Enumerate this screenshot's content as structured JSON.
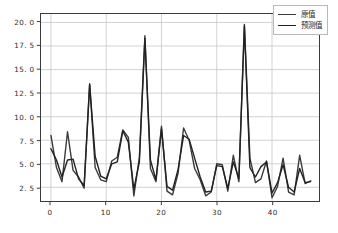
{
  "chart_data": {
    "type": "line",
    "title": "",
    "xlabel": "",
    "ylabel": "",
    "xlim": [
      -1.8,
      48.5
    ],
    "ylim": [
      1.05,
      20.9
    ],
    "grid": true,
    "legend_position": "upper right",
    "xticks": [
      0,
      10,
      20,
      30,
      40
    ],
    "xticklabels": [
      "0",
      "10",
      "20",
      "30",
      "40"
    ],
    "yticks": [
      2.5,
      5.0,
      7.5,
      10.0,
      12.5,
      15.0,
      17.5,
      20.0
    ],
    "yticklabels": [
      "2. 5",
      "5. 0",
      "7. 5",
      "10. 0",
      "12. 5",
      "15. 0",
      "17. 5",
      "20. 0"
    ],
    "x": [
      0,
      1,
      2,
      3,
      4,
      5,
      6,
      7,
      8,
      9,
      10,
      11,
      12,
      13,
      14,
      15,
      16,
      17,
      18,
      19,
      20,
      21,
      22,
      23,
      24,
      25,
      26,
      27,
      28,
      29,
      30,
      31,
      32,
      33,
      34,
      35,
      36,
      37,
      38,
      39,
      40,
      41,
      42,
      43,
      44,
      45,
      46,
      47
    ],
    "series": [
      {
        "name": "原值",
        "color": "#3a3a3a",
        "linewidth": 1.4,
        "values": [
          8.0,
          4.6,
          3.1,
          8.4,
          4.3,
          3.6,
          2.4,
          13.5,
          4.6,
          3.3,
          3.1,
          5.3,
          5.7,
          8.6,
          7.8,
          1.6,
          5.7,
          18.6,
          4.5,
          3.1,
          9.0,
          2.1,
          1.7,
          4.0,
          8.8,
          7.5,
          4.5,
          3.3,
          1.6,
          2.0,
          5.0,
          4.9,
          2.1,
          5.9,
          3.1,
          19.8,
          5.6,
          3.0,
          3.4,
          5.3,
          1.4,
          2.6,
          5.6,
          2.0,
          1.7,
          5.9,
          2.9,
          3.2
        ]
      },
      {
        "name": "预测值",
        "color": "#222222",
        "linewidth": 1.4,
        "values": [
          6.6,
          5.4,
          3.6,
          5.4,
          5.5,
          3.4,
          2.7,
          13.4,
          5.8,
          3.7,
          3.4,
          5.0,
          5.2,
          8.5,
          7.3,
          2.3,
          5.2,
          18.3,
          5.4,
          3.3,
          8.7,
          2.6,
          2.2,
          4.4,
          8.0,
          7.6,
          5.6,
          3.6,
          2.0,
          2.1,
          4.8,
          4.7,
          2.4,
          5.2,
          3.4,
          19.6,
          4.6,
          3.6,
          4.7,
          5.2,
          1.9,
          3.0,
          4.9,
          2.5,
          2.0,
          4.5,
          3.0,
          3.1
        ]
      }
    ]
  },
  "legend": {
    "entries": [
      {
        "label": "原值"
      },
      {
        "label": "预测值"
      }
    ]
  },
  "axes": {
    "spine_color": "#3b3b3b",
    "grid_color": "#c6c6c6",
    "tick_label_color": "#2b2b2b"
  },
  "figure": {
    "background": "#ffffff"
  }
}
